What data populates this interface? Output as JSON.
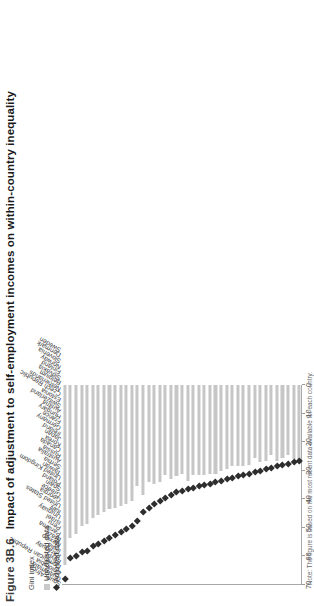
{
  "figure": {
    "number": "Figure 3B.6",
    "title": "Impact of adjustment to self-employment incomes on within-country inequality",
    "note": "Note: The figure is based on the most recent data available for each country."
  },
  "legend": {
    "items": [
      {
        "label": "Unadjusted data",
        "marker": "square",
        "color": "#c6c6c6"
      },
      {
        "label": "Adjusted data",
        "marker": "diamond",
        "color": "#2e2e2e"
      }
    ]
  },
  "axis": {
    "label": "Gini index",
    "ticks": [
      "70",
      "60",
      "50",
      "40",
      "30",
      "20",
      "10",
      "0"
    ]
  },
  "chart_data": {
    "type": "bar",
    "title": "Impact of adjustment to self-employment incomes on within-country inequality",
    "xlabel": "",
    "ylabel": "Gini index",
    "ylim": [
      0,
      70
    ],
    "grid": false,
    "orientation": "horizontal",
    "legend_position": "top-left",
    "categories": [
      "South Africa",
      "Guatemala",
      "Colombia",
      "Dominican Republic",
      "Egypt",
      "Paraguay",
      "India",
      "Mexico",
      "Brazil",
      "Panama",
      "Peru",
      "Israel",
      "Uruguay",
      "Italy",
      "United States",
      "Georgia",
      "Greece",
      "Spain",
      "Poland",
      "United Kingdom",
      "Taiwan",
      "Serbia",
      "Australia",
      "Russia",
      "Canada",
      "Korea",
      "Japan",
      "Ireland",
      "Germany",
      "France",
      "Hungary",
      "Austria",
      "Switzerland",
      "Estonia",
      "Czech Republic",
      "Netherlands",
      "Belgium",
      "Slovakia",
      "Finland",
      "Norway",
      "Slovenia",
      "Denmark",
      "Sweden"
    ],
    "series": [
      {
        "name": "Unadjusted data",
        "color": "#c6c6c6",
        "values": [
          63.0,
          53.5,
          52.0,
          49.5,
          48.5,
          46.5,
          45.5,
          44.5,
          43.5,
          43.0,
          42.5,
          41.5,
          40.5,
          35.5,
          38.5,
          34.0,
          34.5,
          34.0,
          31.5,
          33.0,
          32.0,
          31.0,
          33.5,
          31.5,
          31.5,
          31.5,
          31.0,
          31.0,
          30.0,
          29.5,
          28.5,
          28.5,
          28.5,
          28.0,
          25.5,
          27.0,
          26.5,
          24.5,
          26.5,
          25.5,
          24.5,
          26.0,
          26.0
        ]
      },
      {
        "name": "Adjusted data",
        "color": "#2e2e2e",
        "values": [
          68.0,
          60.5,
          60.0,
          58.5,
          58.0,
          56.5,
          55.5,
          54.5,
          53.5,
          52.5,
          51.5,
          50.5,
          49.5,
          47.5,
          44.5,
          43.0,
          41.5,
          40.5,
          39.5,
          38.5,
          37.5,
          37.0,
          36.5,
          36.0,
          35.5,
          35.0,
          34.5,
          34.0,
          33.5,
          33.0,
          32.5,
          32.0,
          31.5,
          31.0,
          30.5,
          30.0,
          29.5,
          29.0,
          28.5,
          28.0,
          27.5,
          27.0,
          26.5
        ]
      }
    ]
  }
}
